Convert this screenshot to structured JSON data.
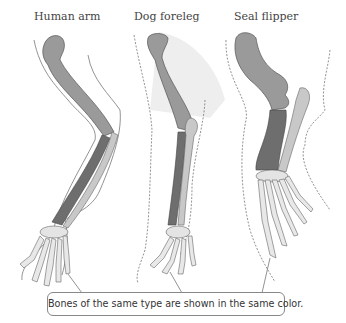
{
  "labels": {
    "human": "Human arm",
    "dog": "Dog foreleg",
    "seal": "Seal flipper"
  },
  "caption": "Bones of the same type are shown in the same color.",
  "colors": {
    "humerus": "#9a9a9a",
    "radius": "#6e6e6e",
    "ulna": "#c8c8c8",
    "carpals_digits": "#e4e4e4",
    "outline": "#777777",
    "fur_shade": "#eeeeee"
  }
}
